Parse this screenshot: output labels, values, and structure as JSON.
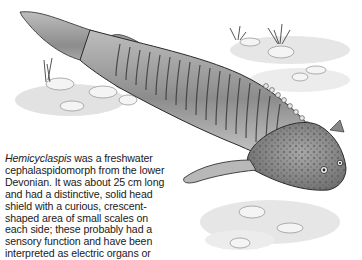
{
  "figure": {
    "colors": {
      "ink": "#2a2a2a",
      "shade": "#8a8a8a",
      "light": "#d8d8d8",
      "paper": "#ffffff"
    }
  },
  "caption": {
    "genus": "Hemicyclaspis",
    "lines": [
      " was a freshwater",
      "cephalaspidomorph from the lower",
      "Devonian. It was about 25 cm long",
      "and had a distinctive, solid head",
      "shield with a curious, crescent-",
      "shaped area of small scales on",
      "each side; these probably had a",
      "sensory function and have been",
      "interpreted as electric organs or"
    ]
  }
}
